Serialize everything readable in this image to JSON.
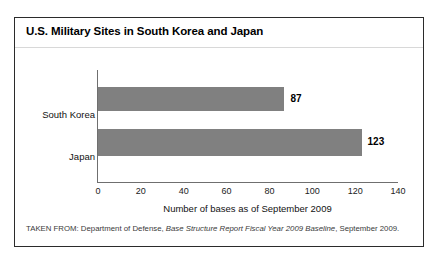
{
  "figure": {
    "title": "U.S. Military Sites in South Korea and Japan",
    "source_note": {
      "prefix": "TAKEN FROM: Department of Defense, ",
      "italic": "Base Structure Report Fiscal Year 2009 Baseline",
      "suffix": ", September 2009."
    }
  },
  "chart_data": {
    "type": "bar",
    "orientation": "horizontal",
    "title": "U.S. Military Sites in South Korea and Japan",
    "categories": [
      "South Korea",
      "Japan"
    ],
    "values": [
      87,
      123
    ],
    "value_labels": [
      "87",
      "123"
    ],
    "xlabel": "Number of bases as of September 2009",
    "ylabel": "",
    "xlim": [
      0,
      140
    ],
    "xticks": [
      0,
      20,
      40,
      60,
      80,
      100,
      120,
      140
    ],
    "xtick_labels": [
      "0",
      "20",
      "40",
      "60",
      "80",
      "100",
      "120",
      "140"
    ],
    "grid": false,
    "legend": null,
    "bar_color": "#808080",
    "axis_color": "#6f6f6f",
    "background": "#ffffff"
  }
}
